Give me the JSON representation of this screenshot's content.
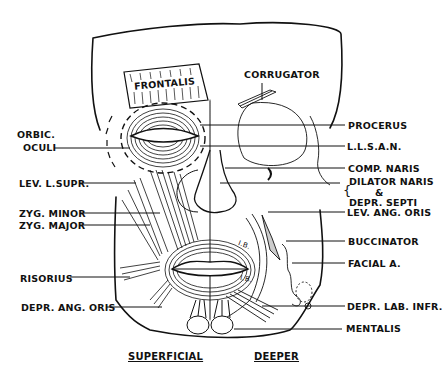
{
  "diagram": {
    "colors": {
      "ink": "#111111",
      "background": "#ffffff"
    },
    "captions": {
      "left": "SUPERFICIAL",
      "right": "DEEPER"
    },
    "inner_labels": {
      "frontalis": "FRONTALIS",
      "ib_upper": "I.B.",
      "ib_lower": "I.B."
    },
    "left_labels": {
      "orbic_oculi_1": "ORBIC.",
      "orbic_oculi_2": "OCULI",
      "lev_l_supr": "LEV. L.SUPR.",
      "zyg_minor": "ZYG. MINOR",
      "zyg_major": "ZYG. MAJOR",
      "risorius": "RISORIUS",
      "depr_ang_oris": "DEPR. ANG. ORIS"
    },
    "right_labels": {
      "corrugator": "CORRUGATOR",
      "procerus": "PROCERUS",
      "llsan": "L.L.S.A.N.",
      "comp_naris": "COMP. NARIS",
      "dilator_naris": "DILATOR NARIS",
      "ampersand": "&",
      "depr_septi": "DEPR. SEPTI",
      "lev_ang_oris": "LEV. ANG. ORIS",
      "buccinator": "BUCCINATOR",
      "facial_a": "FACIAL A.",
      "depr_lab_infr": "DEPR. LAB. INFR.",
      "mentalis": "MENTALIS"
    }
  }
}
